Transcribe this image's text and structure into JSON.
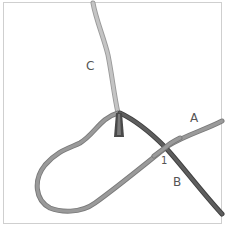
{
  "diagram": {
    "type": "knot-illustration",
    "labels": {
      "a": "A",
      "b": "B",
      "c": "C",
      "step": "1"
    },
    "colors": {
      "strand_c": "#bdbdbd",
      "strand_a": "#8c8c8c",
      "strand_b": "#5a5a5a",
      "border": "#cfcfcf",
      "label": "#555555"
    }
  }
}
